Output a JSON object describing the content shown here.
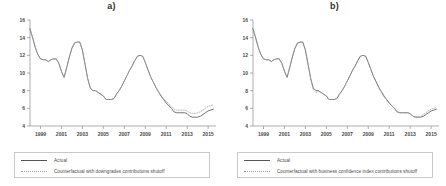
{
  "figure": {
    "panels": [
      {
        "title": "a)",
        "legend": [
          {
            "label": "Actual",
            "style": "solid"
          },
          {
            "label": "Counterfactual with downgrades contributions shutoff",
            "style": "dotted"
          }
        ]
      },
      {
        "title": "b)",
        "legend": [
          {
            "label": "Actual",
            "style": "solid"
          },
          {
            "label": "Counterfactual with business confidence index contributions shutoff",
            "style": "dotted"
          }
        ]
      }
    ]
  },
  "chart_data": [
    {
      "type": "line",
      "title": "a)",
      "xlabel": "",
      "ylabel": "",
      "xlim": [
        1998.0,
        2015.75
      ],
      "ylim": [
        4,
        16
      ],
      "yticks": [
        4,
        6,
        8,
        10,
        12,
        14,
        16
      ],
      "xticks": [
        1999,
        2001,
        2003,
        2005,
        2007,
        2009,
        2011,
        2013,
        2015
      ],
      "grid": false,
      "legend_position": "below",
      "x": [
        1998.0,
        1998.25,
        1998.5,
        1998.75,
        1999.0,
        1999.25,
        1999.5,
        1999.75,
        2000.0,
        2000.25,
        2000.5,
        2000.75,
        2001.0,
        2001.25,
        2001.5,
        2001.75,
        2002.0,
        2002.25,
        2002.5,
        2002.75,
        2003.0,
        2003.25,
        2003.5,
        2003.75,
        2004.0,
        2004.25,
        2004.5,
        2004.75,
        2005.0,
        2005.25,
        2005.5,
        2005.75,
        2006.0,
        2006.25,
        2006.5,
        2006.75,
        2007.0,
        2007.25,
        2007.5,
        2007.75,
        2008.0,
        2008.25,
        2008.5,
        2008.75,
        2009.0,
        2009.25,
        2009.5,
        2009.75,
        2010.0,
        2010.25,
        2010.5,
        2010.75,
        2011.0,
        2011.25,
        2011.5,
        2011.75,
        2012.0,
        2012.25,
        2012.5,
        2012.75,
        2013.0,
        2013.25,
        2013.5,
        2013.75,
        2014.0,
        2014.25,
        2014.5,
        2014.75,
        2015.0,
        2015.25,
        2015.5
      ],
      "series": [
        {
          "name": "Actual",
          "style": "solid",
          "values": [
            15.0,
            14.0,
            12.9,
            12.1,
            11.6,
            11.5,
            11.5,
            11.3,
            11.5,
            11.6,
            11.6,
            11.1,
            10.2,
            9.5,
            10.6,
            11.8,
            12.8,
            13.4,
            13.5,
            13.5,
            12.6,
            11.0,
            9.4,
            8.3,
            8.0,
            8.0,
            7.8,
            7.6,
            7.4,
            7.0,
            7.0,
            7.0,
            7.1,
            7.6,
            8.0,
            8.5,
            9.1,
            9.7,
            10.3,
            10.8,
            11.4,
            11.9,
            12.0,
            11.9,
            11.2,
            10.4,
            9.6,
            9.0,
            8.4,
            7.9,
            7.4,
            7.0,
            6.6,
            6.3,
            6.0,
            5.6,
            5.5,
            5.5,
            5.5,
            5.5,
            5.4,
            5.1,
            5.0,
            5.0,
            5.0,
            5.1,
            5.3,
            5.5,
            5.7,
            5.8,
            5.9
          ]
        },
        {
          "name": "Counterfactual with downgrades contributions shutoff",
          "style": "dotted",
          "values": [
            15.0,
            14.0,
            12.9,
            12.1,
            11.6,
            11.5,
            11.5,
            11.3,
            11.5,
            11.6,
            11.6,
            11.1,
            10.2,
            9.5,
            10.6,
            11.8,
            12.8,
            13.4,
            13.5,
            13.5,
            12.6,
            11.0,
            9.4,
            8.3,
            8.0,
            8.0,
            7.8,
            7.6,
            7.4,
            7.0,
            7.0,
            7.0,
            7.1,
            7.6,
            8.0,
            8.5,
            9.1,
            9.7,
            10.3,
            10.8,
            11.4,
            11.9,
            12.0,
            11.9,
            11.2,
            10.4,
            9.6,
            9.0,
            8.4,
            7.9,
            7.5,
            7.1,
            6.8,
            6.5,
            6.2,
            5.9,
            5.8,
            5.8,
            5.8,
            5.8,
            5.7,
            5.5,
            5.4,
            5.4,
            5.5,
            5.6,
            5.8,
            6.0,
            6.2,
            6.3,
            6.4
          ]
        }
      ]
    },
    {
      "type": "line",
      "title": "b)",
      "xlabel": "",
      "ylabel": "",
      "xlim": [
        1998.0,
        2015.75
      ],
      "ylim": [
        4,
        16
      ],
      "yticks": [
        4,
        6,
        8,
        10,
        12,
        14,
        16
      ],
      "xticks": [
        1999,
        2001,
        2003,
        2005,
        2007,
        2009,
        2011,
        2013,
        2015
      ],
      "grid": false,
      "legend_position": "below",
      "x": [
        1998.0,
        1998.25,
        1998.5,
        1998.75,
        1999.0,
        1999.25,
        1999.5,
        1999.75,
        2000.0,
        2000.25,
        2000.5,
        2000.75,
        2001.0,
        2001.25,
        2001.5,
        2001.75,
        2002.0,
        2002.25,
        2002.5,
        2002.75,
        2003.0,
        2003.25,
        2003.5,
        2003.75,
        2004.0,
        2004.25,
        2004.5,
        2004.75,
        2005.0,
        2005.25,
        2005.5,
        2005.75,
        2006.0,
        2006.25,
        2006.5,
        2006.75,
        2007.0,
        2007.25,
        2007.5,
        2007.75,
        2008.0,
        2008.25,
        2008.5,
        2008.75,
        2009.0,
        2009.25,
        2009.5,
        2009.75,
        2010.0,
        2010.25,
        2010.5,
        2010.75,
        2011.0,
        2011.25,
        2011.5,
        2011.75,
        2012.0,
        2012.25,
        2012.5,
        2012.75,
        2013.0,
        2013.25,
        2013.5,
        2013.75,
        2014.0,
        2014.25,
        2014.5,
        2014.75,
        2015.0,
        2015.25,
        2015.5
      ],
      "series": [
        {
          "name": "Actual",
          "style": "solid",
          "values": [
            15.0,
            14.0,
            12.9,
            12.1,
            11.6,
            11.5,
            11.5,
            11.3,
            11.5,
            11.6,
            11.6,
            11.1,
            10.2,
            9.5,
            10.6,
            11.8,
            12.8,
            13.4,
            13.5,
            13.5,
            12.6,
            11.0,
            9.4,
            8.3,
            8.0,
            8.0,
            7.8,
            7.6,
            7.4,
            7.0,
            7.0,
            7.0,
            7.1,
            7.6,
            8.0,
            8.5,
            9.1,
            9.7,
            10.3,
            10.8,
            11.4,
            11.9,
            12.0,
            11.9,
            11.2,
            10.4,
            9.6,
            9.0,
            8.4,
            7.9,
            7.4,
            7.0,
            6.6,
            6.3,
            6.0,
            5.6,
            5.5,
            5.5,
            5.5,
            5.5,
            5.4,
            5.1,
            5.0,
            5.0,
            5.0,
            5.1,
            5.3,
            5.5,
            5.7,
            5.8,
            5.9
          ]
        },
        {
          "name": "Counterfactual with business confidence index contributions shutoff",
          "style": "dotted",
          "values": [
            15.0,
            14.0,
            12.9,
            12.1,
            11.6,
            11.5,
            11.5,
            11.3,
            11.5,
            11.6,
            11.6,
            11.1,
            10.2,
            9.5,
            10.6,
            11.8,
            12.8,
            13.4,
            13.5,
            13.5,
            12.6,
            11.0,
            9.4,
            8.1,
            7.8,
            7.9,
            7.8,
            7.6,
            7.4,
            7.0,
            7.0,
            7.0,
            7.1,
            7.6,
            8.0,
            8.5,
            9.1,
            9.7,
            10.3,
            10.8,
            11.4,
            11.9,
            12.0,
            11.9,
            11.2,
            10.4,
            9.6,
            9.0,
            8.3,
            7.8,
            7.3,
            6.9,
            6.6,
            6.3,
            6.0,
            5.6,
            5.5,
            5.5,
            5.5,
            5.5,
            5.4,
            5.1,
            5.0,
            5.0,
            5.1,
            5.3,
            5.5,
            5.7,
            5.9,
            6.0,
            6.1
          ]
        }
      ]
    }
  ]
}
